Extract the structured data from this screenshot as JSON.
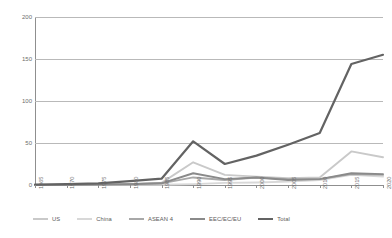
{
  "chart_data": {
    "type": "line",
    "title": "",
    "subtitle": "",
    "xlabel": "",
    "ylabel": "US$bn",
    "ylim": [
      0,
      200
    ],
    "yticks": [
      0,
      50,
      100,
      150,
      200
    ],
    "ytick_labels": [
      "0",
      "50",
      "100",
      "150",
      "200"
    ],
    "grid": true,
    "legend_position": "bottom",
    "categories": [
      "1965",
      "1970",
      "1975",
      "1980",
      "1985",
      "1990",
      "1995",
      "2000",
      "2005",
      "2010",
      "2015",
      "2020"
    ],
    "x": [
      1965,
      1970,
      1975,
      1980,
      1985,
      1990,
      1995,
      2000,
      2005,
      2010,
      2015,
      2020
    ],
    "series": [
      {
        "name": "US",
        "color": "#c9c9c9",
        "values": [
          0.1,
          0.3,
          0.6,
          1.2,
          2.5,
          27,
          12,
          10,
          8,
          9,
          40,
          33
        ]
      },
      {
        "name": "China",
        "color": "#d8d8d8",
        "values": [
          0,
          0,
          0,
          0.1,
          0.3,
          1.0,
          2.5,
          3.0,
          4.0,
          6.0,
          12,
          10
        ]
      },
      {
        "name": "ASEAN 4",
        "color": "#a8a8a8",
        "values": [
          0.1,
          0.2,
          0.5,
          1.0,
          2.0,
          9,
          6,
          9,
          7,
          7,
          13,
          12
        ]
      },
      {
        "name": "EEC/EC/EU",
        "color": "#8a8a8a",
        "values": [
          0.1,
          0.2,
          0.4,
          0.9,
          2.0,
          14,
          7,
          9,
          6,
          7,
          14,
          13
        ]
      },
      {
        "name": "Total",
        "color": "#636363",
        "values": [
          0.5,
          1.0,
          2.0,
          4.5,
          7.5,
          52,
          25,
          35,
          48,
          62,
          144,
          155
        ]
      }
    ]
  },
  "legend": {
    "items": [
      {
        "label": "US"
      },
      {
        "label": "China"
      },
      {
        "label": "ASEAN 4"
      },
      {
        "label": "EEC/EC/EU"
      },
      {
        "label": "Total"
      }
    ]
  },
  "axis": {
    "y_title": "US$bn"
  }
}
